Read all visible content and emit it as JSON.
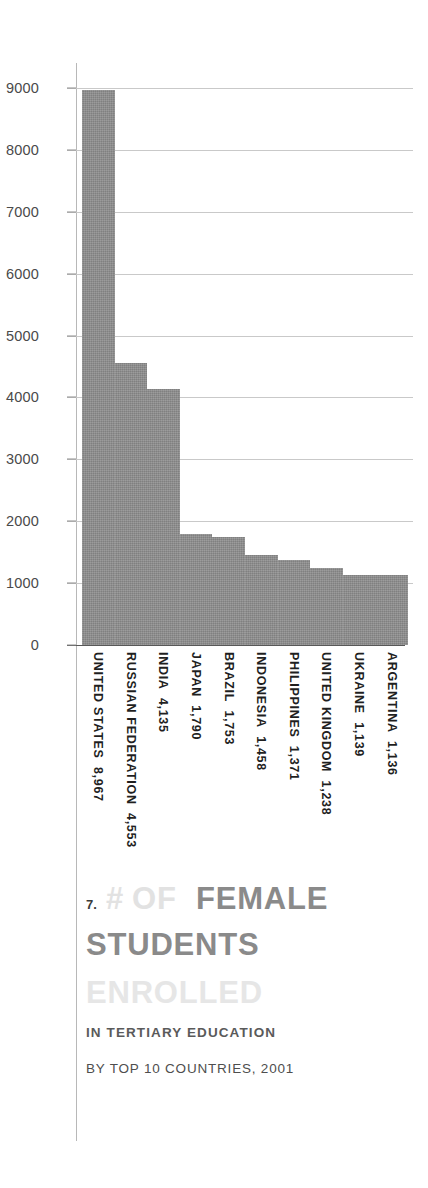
{
  "chart_data": {
    "type": "bar",
    "title": "# OF FEMALE STUDENTS ENROLLED",
    "subtitle": "IN TERTIARY EDUCATION",
    "subtitle2": "BY TOP 10 COUNTRIES, 2001",
    "numbering": "7.",
    "xlabel": "",
    "ylabel": "",
    "ylim": [
      0,
      9000
    ],
    "grid": true,
    "legend": "none",
    "orientation": "vertical",
    "bar_gap": 0,
    "categories": [
      "UNITED STATES",
      "RUSSIAN FEDERATION",
      "INDIA",
      "JAPAN",
      "BRAZIL",
      "INDONESIA",
      "PHILIPPINES",
      "UNITED KINGDOM",
      "UKRAINE",
      "ARGENTINA"
    ],
    "values": [
      8967,
      4553,
      4135,
      1790,
      1753,
      1458,
      1371,
      1238,
      1139,
      1136
    ],
    "value_labels": [
      "8,967",
      "4,553",
      "4,135",
      "1,790",
      "1,753",
      "1,458",
      "1,371",
      "1,238",
      "1,139",
      "1,136"
    ],
    "ytick_labels": [
      "9000",
      "8000",
      "7000",
      "6000",
      "5000",
      "4000",
      "3000",
      "2000",
      "1000",
      "0"
    ],
    "ytick_values": [
      9000,
      8000,
      7000,
      6000,
      5000,
      4000,
      3000,
      2000,
      1000,
      0
    ]
  },
  "title_words": {
    "hash": "#",
    "of": "OF",
    "female": "FEMALE",
    "students": "STUDENTS",
    "enrolled": "ENROLLED"
  },
  "colors": {
    "bar_fill": "#8e8e8e",
    "gridline": "#c9c9c9",
    "baseline": "#585858",
    "axis_spine": "#b8b8b8",
    "title_dark": "#8a8a8a",
    "title_faint": "#e2e2e2",
    "tick_text": "#4a4a4a",
    "label_text": "#1f1f1f"
  },
  "x_label_composites": [
    "UNITED STATES 8,967",
    "RUSSIAN FEDERATION 4,553",
    "INDIA 4,135",
    "JAPAN 1,790",
    "BRAZIL 1,753",
    "INDONESIA 1,458",
    "PHILIPPINES 1,371",
    "UNITED KINGDOM 1,238",
    "UKRAINE 1,139",
    "ARGENTINA 1,136"
  ]
}
